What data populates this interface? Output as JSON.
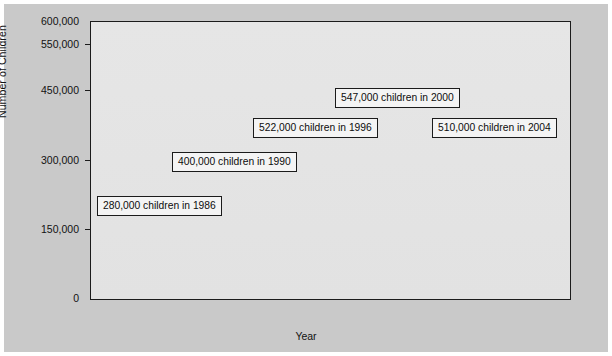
{
  "axes": {
    "y_title": "Number of Children",
    "x_title": "Year",
    "y_ticks": [
      "600,000",
      "550,000",
      "450,000",
      "300,000",
      "150,000",
      "0"
    ],
    "x_ticks": [
      "1986",
      "1988",
      "1990",
      "1992",
      "1994",
      "1996",
      "1998",
      "2000",
      "2002",
      "2004"
    ]
  },
  "annotations": [
    {
      "label": "280,000 children in 1986"
    },
    {
      "label": "400,000 children in 1990"
    },
    {
      "label": "522,000 children in 1996"
    },
    {
      "label": "547,000 children in 2000"
    },
    {
      "label": "510,000 children in 2004"
    }
  ],
  "colors": {
    "page_background": "#c9c9c9",
    "plot_background": "#e4e4e4",
    "area_fill": "#b4b4b4",
    "line": "#141414",
    "axis": "#1b1b1b",
    "callout_background": "#f4f4f4"
  },
  "chart_data": {
    "type": "area",
    "title": "",
    "xlabel": "Year",
    "ylabel": "Number of Children",
    "xlim": [
      1986,
      2004
    ],
    "ylim": [
      0,
      600000
    ],
    "grid": false,
    "legend": "none",
    "y_tick_values": [
      600000,
      550000,
      450000,
      300000,
      150000,
      0
    ],
    "y_tick_labels": [
      "600,000",
      "550,000",
      "450,000",
      "300,000",
      "150,000",
      "0"
    ],
    "x_tick_values": [
      1986,
      1988,
      1990,
      1992,
      1994,
      1996,
      1998,
      2000,
      2002,
      2004
    ],
    "x_minor_tick_values": [
      1987,
      1989,
      1991,
      1993,
      1995,
      1997,
      1999,
      2001,
      2003
    ],
    "x": [
      1986,
      1987,
      1988,
      1989,
      1990,
      1991,
      1992,
      1993,
      1994,
      1995,
      1996,
      1997,
      1998,
      1999,
      2000,
      2001,
      2002,
      2003,
      2004
    ],
    "y": [
      280000,
      300000,
      330000,
      365000,
      400000,
      420000,
      438000,
      455000,
      490000,
      505000,
      522000,
      530000,
      535000,
      541000,
      547000,
      542000,
      535000,
      524000,
      510000
    ],
    "series": [
      {
        "name": "Number of Children",
        "values": [
          280000,
          300000,
          330000,
          365000,
          400000,
          420000,
          438000,
          455000,
          490000,
          505000,
          522000,
          530000,
          535000,
          541000,
          547000,
          542000,
          535000,
          524000,
          510000
        ]
      }
    ],
    "annotations": [
      {
        "text": "280,000 children in 1986",
        "x": 1986,
        "y": 280000
      },
      {
        "text": "400,000 children in 1990",
        "x": 1990,
        "y": 400000
      },
      {
        "text": "522,000 children in 1996",
        "x": 1996,
        "y": 522000
      },
      {
        "text": "547,000 children in 2000",
        "x": 2000,
        "y": 547000
      },
      {
        "text": "510,000 children in 2004",
        "x": 2004,
        "y": 510000
      }
    ]
  }
}
